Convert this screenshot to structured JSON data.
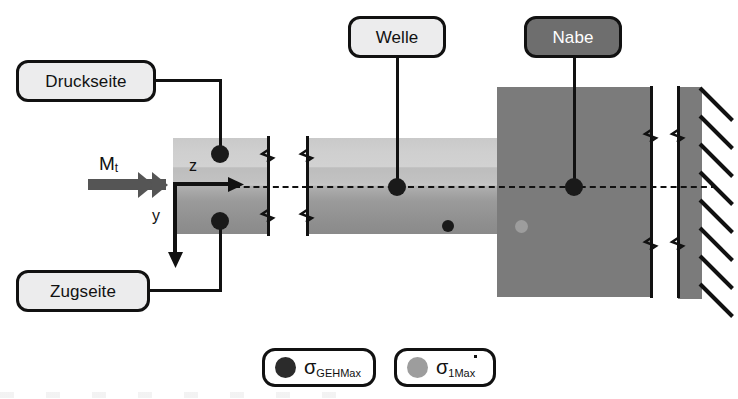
{
  "diagram": {
    "callouts": [
      {
        "id": "druckseite",
        "label": "Druckseite",
        "style": "light"
      },
      {
        "id": "zugseite",
        "label": "Zugseite",
        "style": "light"
      },
      {
        "id": "welle",
        "label": "Welle",
        "style": "light"
      },
      {
        "id": "nabe",
        "label": "Nabe",
        "style": "dark"
      }
    ],
    "annotations": {
      "torque_symbol": "M",
      "torque_subscript": "t",
      "axis_z": "z",
      "axis_y": "y"
    },
    "components": {
      "shaft_name": "Welle",
      "hub_name": "Nabe",
      "wall_name": "feste Einspannung"
    },
    "markers": [
      {
        "name": "geh-marker-pressure-side",
        "type": "GEHMax"
      },
      {
        "name": "geh-marker-tension-side",
        "type": "GEHMax"
      },
      {
        "name": "geh-marker-shaft-center",
        "type": "GEHMax"
      },
      {
        "name": "geh-marker-hub-center",
        "type": "GEHMax"
      },
      {
        "name": "geh-marker-shaft-lower",
        "type": "GEHMax"
      },
      {
        "name": "s1-marker-hub-lower",
        "type": "1Max"
      }
    ],
    "colors": {
      "marker_geh": "#1a1a1a",
      "marker_s1": "#9d9d9d",
      "hub_fill": "#7b7b7b",
      "callout_dark_fill": "#6e6e6e",
      "callout_light_fill": "#ececed",
      "outline": "#111111"
    }
  },
  "legend": {
    "items": [
      {
        "symbol": "σ",
        "subscript": "GEHMax",
        "dot_color": "#2b2b2b"
      },
      {
        "symbol": "σ",
        "subscript": "1Max",
        "dot_color": "#9d9d9d"
      }
    ]
  }
}
